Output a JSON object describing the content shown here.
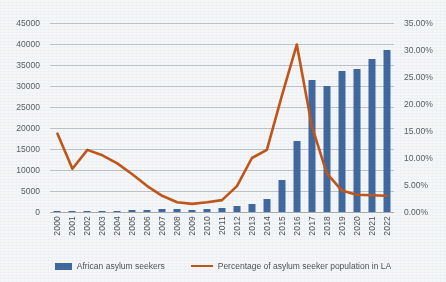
{
  "header": {
    "cropped_text": ""
  },
  "legend": {
    "position": "bottom",
    "items": [
      {
        "label": "African asylum seekers",
        "marker": "bar-swatch",
        "color": "#41699F"
      },
      {
        "label": "Percentage of asylum seeker population in LA",
        "marker": "line-swatch",
        "color": "#C1561A"
      }
    ]
  },
  "axes": {
    "left_ticks": [
      "45000",
      "40000",
      "35000",
      "30000",
      "25000",
      "20000",
      "15000",
      "10000",
      "5000",
      "0"
    ],
    "right_ticks": [
      "35.00%",
      "30.00%",
      "25.00%",
      "20.00%",
      "15.00%",
      "10.00%",
      "5.00%",
      "0.00%"
    ]
  },
  "chart_data": {
    "type": "bar",
    "title": "",
    "subtitle": "",
    "xlabel": "",
    "ylabel": "",
    "y2label": "",
    "grid": true,
    "legend_position": "bottom",
    "categories": [
      "2000",
      "2001",
      "2002",
      "2003",
      "2004",
      "2005",
      "2006",
      "2007",
      "2008",
      "2009",
      "2010",
      "2011",
      "2012",
      "2013",
      "2014",
      "2015",
      "2016",
      "2017",
      "2018",
      "2019",
      "2020",
      "2021",
      "2022"
    ],
    "ylim": [
      0,
      45000
    ],
    "y2lim": [
      0,
      0.35
    ],
    "series": [
      {
        "name": "African asylum seekers",
        "type": "bar",
        "axis": "left",
        "color": "#41699F",
        "values": [
          200,
          250,
          300,
          350,
          300,
          400,
          450,
          700,
          600,
          500,
          600,
          900,
          1400,
          2000,
          3000,
          7700,
          17000,
          31500,
          30000,
          33500,
          34000,
          36500,
          38500
        ]
      },
      {
        "name": "Percentage of asylum seeker population in LA",
        "type": "line",
        "axis": "right",
        "color": "#C1561A",
        "values": [
          0.145,
          0.08,
          0.115,
          0.105,
          0.09,
          0.07,
          0.048,
          0.03,
          0.018,
          0.015,
          0.018,
          0.022,
          0.048,
          0.1,
          0.115,
          0.215,
          0.31,
          0.16,
          0.072,
          0.04,
          0.032,
          0.031,
          0.03
        ]
      }
    ]
  }
}
